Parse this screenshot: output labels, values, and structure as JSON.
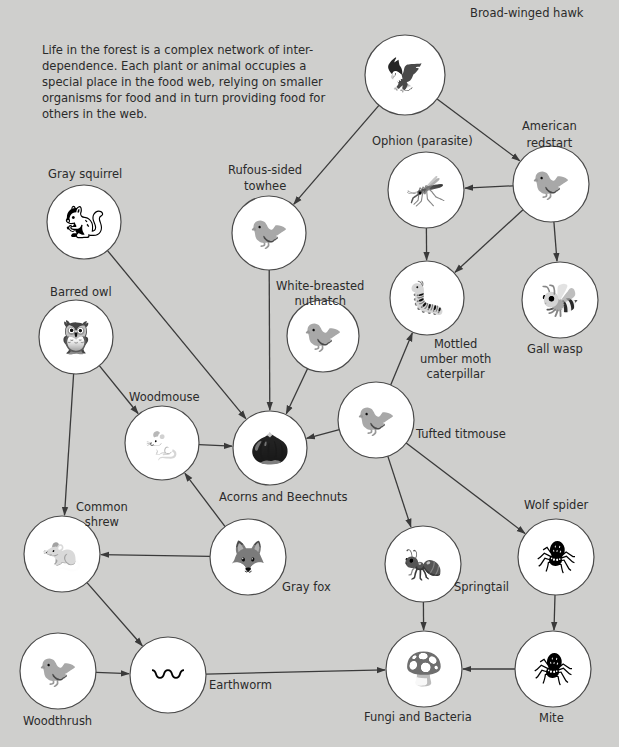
{
  "intro_text": "Life in the forest is a complex network of inter-dependence. Each plant or animal occupies a special place in the food web, relying on smaller organisms for food and in turn providing food for others in the web.",
  "colors": {
    "background": "#cfcfcd",
    "circle_fill": "#ffffff",
    "line": "#3a3a3a",
    "text": "#2b2b2b"
  },
  "nodes": [
    {
      "id": "hawk",
      "label": "Broad-winged hawk",
      "cx": 405,
      "cy": 75,
      "r": 40,
      "icon": "hawk-icon"
    },
    {
      "id": "redstart",
      "label": "American redstart",
      "cx": 551,
      "cy": 184,
      "r": 38,
      "icon": "redstart-icon"
    },
    {
      "id": "ophion",
      "label": "Ophion (parasite)",
      "cx": 426,
      "cy": 190,
      "r": 38,
      "icon": "wasp-icon"
    },
    {
      "id": "towhee",
      "label": "Rufous-sided towhee",
      "cx": 269,
      "cy": 233,
      "r": 37,
      "icon": "towhee-icon"
    },
    {
      "id": "squirrel",
      "label": "Gray squirrel",
      "cx": 84,
      "cy": 222,
      "r": 37,
      "icon": "squirrel-icon"
    },
    {
      "id": "owl",
      "label": "Barred owl",
      "cx": 76,
      "cy": 337,
      "r": 37,
      "icon": "owl-icon"
    },
    {
      "id": "nuthatch",
      "label": "White-breasted nuthatch",
      "cx": 323,
      "cy": 336,
      "r": 36,
      "icon": "nuthatch-icon"
    },
    {
      "id": "caterpillar",
      "label": "Mottled umber moth caterpillar",
      "cx": 427,
      "cy": 298,
      "r": 37,
      "icon": "caterpillar-icon"
    },
    {
      "id": "gallwasp",
      "label": "Gall wasp",
      "cx": 560,
      "cy": 300,
      "r": 38,
      "icon": "gall-wasp-icon"
    },
    {
      "id": "woodmouse",
      "label": "Woodmouse",
      "cx": 162,
      "cy": 443,
      "r": 37,
      "icon": "mouse-icon"
    },
    {
      "id": "acorns",
      "label": "Acorns and Beechnuts",
      "cx": 270,
      "cy": 448,
      "r": 37,
      "icon": "acorn-icon"
    },
    {
      "id": "titmouse",
      "label": "Tufted titmouse",
      "cx": 376,
      "cy": 420,
      "r": 38,
      "icon": "titmouse-icon"
    },
    {
      "id": "shrew",
      "label": "Common shrew",
      "cx": 62,
      "cy": 554,
      "r": 38,
      "icon": "shrew-icon"
    },
    {
      "id": "fox",
      "label": "Gray fox",
      "cx": 248,
      "cy": 557,
      "r": 38,
      "icon": "fox-icon"
    },
    {
      "id": "springtail",
      "label": "Springtail",
      "cx": 423,
      "cy": 564,
      "r": 38,
      "icon": "springtail-icon"
    },
    {
      "id": "wolfspider",
      "label": "Wolf spider",
      "cx": 556,
      "cy": 557,
      "r": 38,
      "icon": "spider-icon"
    },
    {
      "id": "woodthrush",
      "label": "Woodthrush",
      "cx": 58,
      "cy": 671,
      "r": 38,
      "icon": "thrush-icon"
    },
    {
      "id": "earthworm",
      "label": "Earthworm",
      "cx": 168,
      "cy": 675,
      "r": 38,
      "icon": "earthworm-icon"
    },
    {
      "id": "fungi",
      "label": "Fungi and Bacteria",
      "cx": 424,
      "cy": 669,
      "r": 38,
      "icon": "fungi-icon"
    },
    {
      "id": "mite",
      "label": "Mite",
      "cx": 553,
      "cy": 669,
      "r": 38,
      "icon": "mite-icon"
    }
  ],
  "labels": {
    "hawk": [
      "Broad-winged hawk"
    ],
    "redstart": [
      "American",
      "redstart"
    ],
    "ophion": [
      "Ophion (parasite)"
    ],
    "towhee": [
      "Rufous-sided",
      "towhee"
    ],
    "squirrel": [
      "Gray squirrel"
    ],
    "owl": [
      "Barred owl"
    ],
    "nuthatch": [
      "White-breasted",
      "nuthatch"
    ],
    "caterpillar": [
      "Mottled",
      "umber moth",
      "caterpillar"
    ],
    "gallwasp": [
      "Gall wasp"
    ],
    "woodmouse": [
      "Woodmouse"
    ],
    "acorns": [
      "Acorns and Beechnuts"
    ],
    "titmouse": [
      "Tufted titmouse"
    ],
    "shrew": [
      "Common",
      "shrew"
    ],
    "fox": [
      "Gray fox"
    ],
    "springtail": [
      "Springtail"
    ],
    "wolfspider": [
      "Wolf spider"
    ],
    "woodthrush": [
      "Woodthrush"
    ],
    "earthworm": [
      "Earthworm"
    ],
    "fungi": [
      "Fungi and Bacteria"
    ],
    "mite": [
      "Mite"
    ]
  },
  "edges": [
    {
      "from": "hawk",
      "to": "towhee"
    },
    {
      "from": "hawk",
      "to": "redstart"
    },
    {
      "from": "redstart",
      "to": "ophion"
    },
    {
      "from": "redstart",
      "to": "caterpillar"
    },
    {
      "from": "redstart",
      "to": "gallwasp"
    },
    {
      "from": "ophion",
      "to": "caterpillar"
    },
    {
      "from": "squirrel",
      "to": "acorns"
    },
    {
      "from": "towhee",
      "to": "acorns"
    },
    {
      "from": "nuthatch",
      "to": "acorns"
    },
    {
      "from": "owl",
      "to": "woodmouse"
    },
    {
      "from": "owl",
      "to": "shrew"
    },
    {
      "from": "woodmouse",
      "to": "acorns"
    },
    {
      "from": "titmouse",
      "to": "acorns"
    },
    {
      "from": "titmouse",
      "to": "caterpillar"
    },
    {
      "from": "titmouse",
      "to": "springtail"
    },
    {
      "from": "titmouse",
      "to": "wolfspider"
    },
    {
      "from": "fox",
      "to": "woodmouse"
    },
    {
      "from": "fox",
      "to": "shrew"
    },
    {
      "from": "shrew",
      "to": "earthworm"
    },
    {
      "from": "woodthrush",
      "to": "earthworm"
    },
    {
      "from": "earthworm",
      "to": "fungi"
    },
    {
      "from": "springtail",
      "to": "fungi"
    },
    {
      "from": "wolfspider",
      "to": "mite"
    },
    {
      "from": "mite",
      "to": "fungi"
    }
  ]
}
